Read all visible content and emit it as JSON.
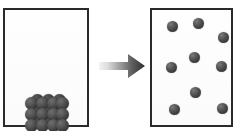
{
  "diagram": {
    "stage_labels": {
      "before": "packed crystal lattice in container",
      "after": "dispersed particles in container"
    },
    "colors": {
      "particle_dark": "#2e2e2e",
      "particle_mid": "#5c5c5c",
      "particle_highlight": "#7a7a7a",
      "box_border": "#2a2a2a",
      "box_fill": "#fdfdfd",
      "arrow_light": "#e9e9e9",
      "arrow_dark": "#3a3a3a",
      "background": "#ffffff"
    }
  },
  "left_container": {
    "name": "left-container",
    "border_color": "#2a2a2a",
    "lattice": {
      "name": "crystal-lattice",
      "rows": 3,
      "columns_front": 4,
      "columns_back": 3,
      "sphere_count": 21,
      "sphere_diameter_px": 13,
      "back_spheres": [
        {
          "x": 6,
          "y": 0
        },
        {
          "x": 17,
          "y": 0
        },
        {
          "x": 28,
          "y": 0
        },
        {
          "x": 6,
          "y": 11
        },
        {
          "x": 17,
          "y": 11
        },
        {
          "x": 28,
          "y": 11
        },
        {
          "x": 6,
          "y": 22
        },
        {
          "x": 17,
          "y": 22
        },
        {
          "x": 28,
          "y": 22
        }
      ],
      "front_spheres": [
        {
          "x": 0,
          "y": 3
        },
        {
          "x": 11,
          "y": 3
        },
        {
          "x": 22,
          "y": 3
        },
        {
          "x": 31,
          "y": 3
        },
        {
          "x": 0,
          "y": 14
        },
        {
          "x": 11,
          "y": 14
        },
        {
          "x": 22,
          "y": 14
        },
        {
          "x": 31,
          "y": 14
        },
        {
          "x": 0,
          "y": 25
        },
        {
          "x": 11,
          "y": 25
        },
        {
          "x": 22,
          "y": 25
        },
        {
          "x": 31,
          "y": 25
        }
      ]
    }
  },
  "arrow": {
    "name": "transition-arrow",
    "direction": "right",
    "gradient_from": "#ececec",
    "gradient_to": "#333333"
  },
  "right_container": {
    "name": "right-container",
    "border_color": "#2a2a2a",
    "particle_count": 9,
    "particles": [
      {
        "id": 1,
        "x": 167,
        "y": 21,
        "d": 11
      },
      {
        "id": 2,
        "x": 193,
        "y": 18,
        "d": 11
      },
      {
        "id": 3,
        "x": 218,
        "y": 32,
        "d": 11
      },
      {
        "id": 4,
        "x": 189,
        "y": 52,
        "d": 11
      },
      {
        "id": 5,
        "x": 166,
        "y": 62,
        "d": 11
      },
      {
        "id": 6,
        "x": 216,
        "y": 61,
        "d": 11
      },
      {
        "id": 7,
        "x": 190,
        "y": 87,
        "d": 11
      },
      {
        "id": 8,
        "x": 169,
        "y": 104,
        "d": 11
      },
      {
        "id": 9,
        "x": 217,
        "y": 103,
        "d": 11
      }
    ]
  }
}
